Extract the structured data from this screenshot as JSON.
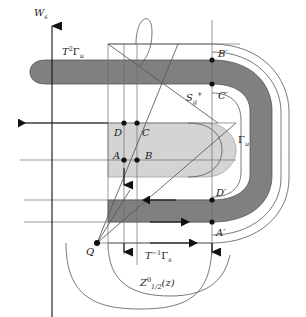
{
  "figure": {
    "background_color": "#ffffff",
    "width": 306,
    "height": 317,
    "colors": {
      "dark_band": "#808080",
      "light_band": "#d4d4d4",
      "outline": "#4d4d4d",
      "thin_line": "#6e6e6e",
      "ink": "#1a1a1a"
    }
  },
  "labels": {
    "w_s": {
      "base": "W",
      "sub": "s",
      "x": 34,
      "y": 16
    },
    "t2gamma_u": {
      "base": "T",
      "sup": "2",
      "mid": "Γ",
      "sub": "u",
      "x": 62,
      "y": 55
    },
    "s_g_plus": {
      "base": "S",
      "sub": "g",
      "sup": "+",
      "x": 186,
      "y": 101
    },
    "gamma_u": {
      "base": "Γ",
      "sub": "u",
      "x": 238,
      "y": 143
    },
    "t_inv_gamma_s": {
      "base": "T",
      "sup": "−1",
      "mid": "Γ",
      "sub": "s",
      "x": 145,
      "y": 259
    },
    "z_half": {
      "base": "Z",
      "sup": "0",
      "sub": "1/2",
      "tail": "(z)",
      "x": 140,
      "y": 286
    }
  },
  "points": [
    {
      "name": "B-prime",
      "label": "B′",
      "x": 212,
      "y": 60,
      "lx": 218,
      "ly": 57
    },
    {
      "name": "C-prime",
      "label": "C′",
      "x": 212,
      "y": 84,
      "lx": 218,
      "ly": 99
    },
    {
      "name": "D",
      "label": "D",
      "x": 124,
      "y": 123,
      "lx": 114,
      "ly": 136
    },
    {
      "name": "C",
      "label": "C",
      "x": 137,
      "y": 123,
      "lx": 142,
      "ly": 136
    },
    {
      "name": "A",
      "label": "A",
      "x": 124,
      "y": 160,
      "lx": 114,
      "ly": 160
    },
    {
      "name": "B",
      "label": "B",
      "x": 137,
      "y": 160,
      "lx": 145,
      "ly": 160
    },
    {
      "name": "D-prime",
      "label": "D′",
      "x": 212,
      "y": 200,
      "lx": 216,
      "ly": 196
    },
    {
      "name": "A-prime",
      "label": "A′",
      "x": 212,
      "y": 222,
      "lx": 216,
      "ly": 236
    },
    {
      "name": "Q",
      "label": "Q",
      "x": 97,
      "y": 243,
      "lx": 87,
      "ly": 252
    }
  ],
  "axes": {
    "ws_arrow": {
      "x": 52,
      "y_top": 20,
      "y_bottom": 317
    }
  }
}
